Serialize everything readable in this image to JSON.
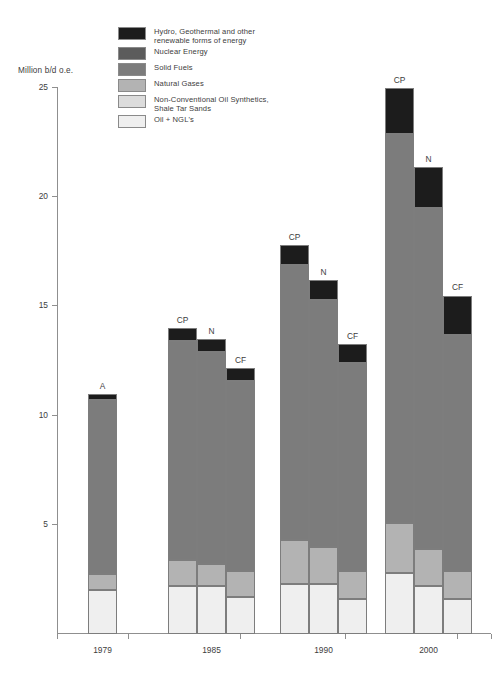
{
  "axis_title": "Million b/d o.e.",
  "legend": {
    "items": [
      {
        "label": "Hydro, Geothermal and other\nrenewable forms of energy",
        "color": "#1c1c1c",
        "key": "hydro"
      },
      {
        "label": "Nuclear Energy",
        "color": "#5c5c5c",
        "key": "nuclear"
      },
      {
        "label": "Solid Fuels",
        "color": "#7c7c7c",
        "key": "solid"
      },
      {
        "label": "Natural Gases",
        "color": "#b3b3b3",
        "key": "gas"
      },
      {
        "label": "Non-Conventional Oil Synthetics,\nShale Tar Sands",
        "color": "#dcdcdc",
        "key": "nonconv"
      },
      {
        "label": "Oil + NGL's",
        "color": "#efefef",
        "key": "oil"
      }
    ]
  },
  "chart_data": {
    "type": "bar",
    "subtype": "stacked-grouped",
    "title": "",
    "xlabel": "",
    "ylabel": "Million b/d o.e.",
    "ylim": [
      0,
      25
    ],
    "yticks": [
      5,
      10,
      15,
      20,
      25
    ],
    "grid": false,
    "legend_position": "top-left",
    "categories": [
      "1979",
      "1985",
      "1990",
      "2000"
    ],
    "series": [
      {
        "name": "Oil + NGL's",
        "color": "#efefef"
      },
      {
        "name": "Non-Conventional Oil Synthetics, Shale Tar Sands",
        "color": "#dcdcdc"
      },
      {
        "name": "Natural Gases",
        "color": "#b3b3b3"
      },
      {
        "name": "Solid Fuels",
        "color": "#7c7c7c"
      },
      {
        "name": "Nuclear Energy",
        "color": "#5c5c5c"
      },
      {
        "name": "Hydro, Geothermal and other renewable forms of energy",
        "color": "#1c1c1c"
      }
    ],
    "scenario_labels": [
      "A",
      "CP",
      "N",
      "CF"
    ],
    "groups": [
      {
        "category": "1979",
        "bars": [
          {
            "label": "A",
            "total": 11.0,
            "segments": [
              {
                "name": "Oil + NGL's",
                "value": 2.0
              },
              {
                "name": "Natural Gases",
                "value": 0.75
              },
              {
                "name": "Solid Fuels",
                "value": 7.95
              },
              {
                "name": "Hydro, Geothermal and other renewable forms of energy",
                "value": 0.3
              }
            ]
          }
        ]
      },
      {
        "category": "1985",
        "bars": [
          {
            "label": "CP",
            "total": 14.0,
            "segments": [
              {
                "name": "Oil + NGL's",
                "value": 2.2
              },
              {
                "name": "Natural Gases",
                "value": 1.2
              },
              {
                "name": "Solid Fuels",
                "value": 10.0
              },
              {
                "name": "Hydro, Geothermal and other renewable forms of energy",
                "value": 0.6
              }
            ]
          },
          {
            "label": "N",
            "total": 13.5,
            "segments": [
              {
                "name": "Oil + NGL's",
                "value": 2.2
              },
              {
                "name": "Natural Gases",
                "value": 1.0
              },
              {
                "name": "Solid Fuels",
                "value": 9.7
              },
              {
                "name": "Hydro, Geothermal and other renewable forms of energy",
                "value": 0.6
              }
            ]
          },
          {
            "label": "CF",
            "total": 12.2,
            "segments": [
              {
                "name": "Oil + NGL's",
                "value": 1.7
              },
              {
                "name": "Natural Gases",
                "value": 1.2
              },
              {
                "name": "Solid Fuels",
                "value": 8.7
              },
              {
                "name": "Hydro, Geothermal and other renewable forms of energy",
                "value": 0.6
              }
            ]
          }
        ]
      },
      {
        "category": "1990",
        "bars": [
          {
            "label": "CP",
            "total": 17.8,
            "segments": [
              {
                "name": "Oil + NGL's",
                "value": 2.3
              },
              {
                "name": "Natural Gases",
                "value": 2.0
              },
              {
                "name": "Solid Fuels",
                "value": 12.6
              },
              {
                "name": "Hydro, Geothermal and other renewable forms of energy",
                "value": 0.9
              }
            ]
          },
          {
            "label": "N",
            "total": 16.2,
            "segments": [
              {
                "name": "Oil + NGL's",
                "value": 2.3
              },
              {
                "name": "Natural Gases",
                "value": 1.7
              },
              {
                "name": "Solid Fuels",
                "value": 11.3
              },
              {
                "name": "Hydro, Geothermal and other renewable forms of energy",
                "value": 0.9
              }
            ]
          },
          {
            "label": "CF",
            "total": 13.3,
            "segments": [
              {
                "name": "Oil + NGL's",
                "value": 1.6
              },
              {
                "name": "Natural Gases",
                "value": 1.3
              },
              {
                "name": "Solid Fuels",
                "value": 9.5
              },
              {
                "name": "Hydro, Geothermal and other renewable forms of energy",
                "value": 0.9
              }
            ]
          }
        ]
      },
      {
        "category": "2000",
        "bars": [
          {
            "label": "CP",
            "total": 25.0,
            "segments": [
              {
                "name": "Oil + NGL's",
                "value": 2.8
              },
              {
                "name": "Natural Gases",
                "value": 2.3
              },
              {
                "name": "Solid Fuels",
                "value": 17.8
              },
              {
                "name": "Hydro, Geothermal and other renewable forms of energy",
                "value": 2.1
              }
            ]
          },
          {
            "label": "N",
            "total": 21.4,
            "segments": [
              {
                "name": "Oil + NGL's",
                "value": 2.2
              },
              {
                "name": "Natural Gases",
                "value": 1.7
              },
              {
                "name": "Solid Fuels",
                "value": 15.6
              },
              {
                "name": "Hydro, Geothermal and other renewable forms of energy",
                "value": 1.9
              }
            ]
          },
          {
            "label": "CF",
            "total": 15.5,
            "segments": [
              {
                "name": "Oil + NGL's",
                "value": 1.6
              },
              {
                "name": "Natural Gases",
                "value": 1.3
              },
              {
                "name": "Solid Fuels",
                "value": 10.8
              },
              {
                "name": "Hydro, Geothermal and other renewable forms of energy",
                "value": 1.8
              }
            ]
          }
        ]
      }
    ]
  }
}
